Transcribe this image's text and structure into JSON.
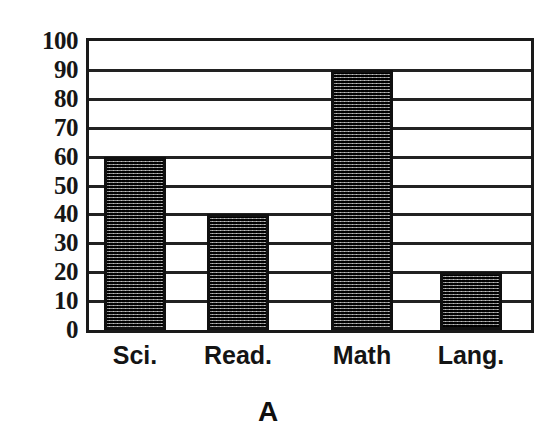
{
  "figure": {
    "caption": "A",
    "background_color": "#ffffff",
    "ink_color": "#141414",
    "bar_fill_color": "#3a3a3a",
    "bar_edge_color": "#101010"
  },
  "chart_data": {
    "type": "bar",
    "title": "",
    "subtitle": "",
    "xlabel": "",
    "ylabel": "",
    "categories": [
      "Sci.",
      "Read.",
      "Math",
      "Lang."
    ],
    "values": [
      60,
      40,
      90,
      20
    ],
    "series": [
      {
        "name": "A",
        "values": [
          60,
          40,
          90,
          20
        ]
      }
    ],
    "ylim": [
      0,
      100
    ],
    "ytick_labels": [
      "100",
      "90",
      "80",
      "70",
      "60",
      "50",
      "40",
      "30",
      "20",
      "10",
      "0"
    ],
    "ytick_values": [
      100,
      90,
      80,
      70,
      60,
      50,
      40,
      30,
      20,
      10,
      0
    ],
    "ytick_step": 10,
    "grid": true,
    "grid_axis": "y",
    "legend": false,
    "legend_position": "none",
    "annotations": [
      "A"
    ],
    "bar_fill_pattern": "dotted-checker"
  }
}
